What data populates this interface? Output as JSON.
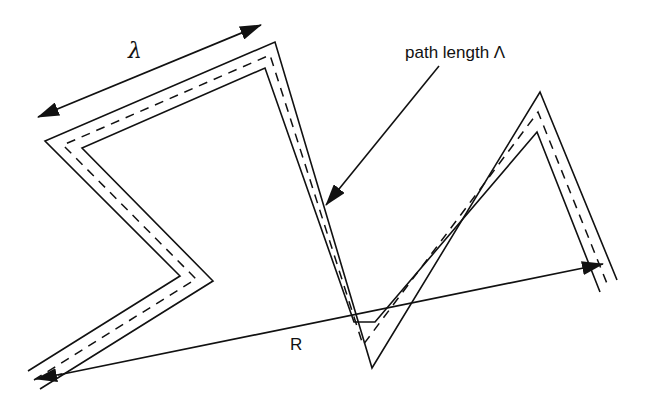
{
  "figure": {
    "labels": {
      "lambda": "λ",
      "path_length": "path length Λ",
      "R": "R"
    },
    "colors": {
      "stroke": "#111111",
      "background": "#ffffff"
    }
  }
}
